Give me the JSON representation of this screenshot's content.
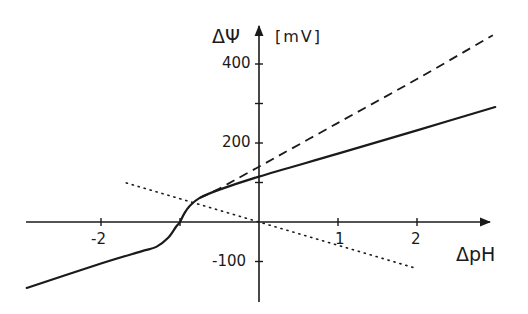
{
  "chart_data": {
    "type": "line",
    "title": "",
    "xlabel": "ΔpH",
    "ylabel": "ΔΨ",
    "yunit": "[mV]",
    "xlim": [
      -3,
      3.1
    ],
    "ylim": [
      -190,
      480
    ],
    "grid": false,
    "legend": null,
    "x_ticks": [
      -2,
      -1,
      1,
      2
    ],
    "x_tick_labels": [
      "-2",
      "1",
      "2"
    ],
    "y_ticks": [
      -100,
      100,
      200,
      300,
      400
    ],
    "y_tick_labels": [
      "400",
      "200",
      "-100"
    ],
    "series": [
      {
        "name": "solid curve",
        "style": "solid",
        "points": [
          [
            -2.94,
            -167
          ],
          [
            -2.0,
            -105
          ],
          [
            -1.5,
            -75
          ],
          [
            -1.3,
            -63
          ],
          [
            -1.15,
            -40
          ],
          [
            -1.05,
            -12
          ],
          [
            -1.0,
            0
          ],
          [
            -0.95,
            20
          ],
          [
            -0.88,
            40
          ],
          [
            -0.75,
            61
          ],
          [
            -0.5,
            82
          ],
          [
            0,
            115
          ],
          [
            1,
            173
          ],
          [
            2,
            232
          ],
          [
            2.99,
            291
          ]
        ]
      },
      {
        "name": "dashed line",
        "style": "dashed",
        "points": [
          [
            -0.75,
            61
          ],
          [
            -0.5,
            85
          ],
          [
            0,
            140
          ],
          [
            1,
            251
          ],
          [
            2,
            362
          ],
          [
            2.96,
            473
          ]
        ]
      },
      {
        "name": "dotted line (-59 mV/pH)",
        "style": "dotted",
        "points": [
          [
            -1.68,
            99
          ],
          [
            0,
            0
          ],
          [
            1.95,
            -115
          ]
        ]
      }
    ]
  },
  "labels": {
    "y_axis_symbol": "ΔΨ",
    "y_axis_unit": "[mV]",
    "x_axis_symbol": "ΔpH",
    "tick_400": "400",
    "tick_200": "200",
    "tick_m100": "-100",
    "tick_m2": "-2",
    "tick_1": "1",
    "tick_2": "2"
  }
}
